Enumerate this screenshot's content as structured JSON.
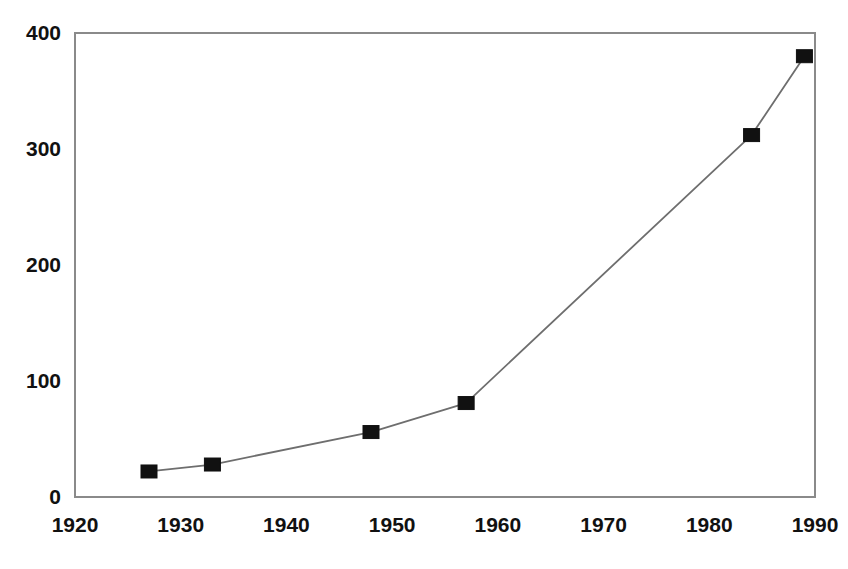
{
  "chart_data": {
    "type": "line",
    "title": "",
    "subtitle": "",
    "xlabel": "",
    "ylabel": "",
    "xlim": [
      1920,
      1990
    ],
    "ylim": [
      0,
      400
    ],
    "grid": false,
    "legend": null,
    "legend_position": "none",
    "x_ticks": [
      1920,
      1930,
      1940,
      1950,
      1960,
      1970,
      1980,
      1990
    ],
    "x_tick_labels": [
      "1920",
      "1930",
      "1940",
      "1950",
      "1960",
      "1970",
      "1980",
      "1990"
    ],
    "y_ticks": [
      0,
      100,
      200,
      300,
      400
    ],
    "y_tick_labels": [
      "0",
      "100",
      "200",
      "300",
      "400"
    ],
    "marker": "filled-square",
    "series": [
      {
        "name": "series-1",
        "color": "#111111",
        "line_color": "#6e6e6e",
        "x": [
          1927,
          1933,
          1948,
          1957,
          1984,
          1989
        ],
        "values": [
          22,
          28,
          56,
          81,
          312,
          380
        ],
        "points": [
          {
            "x": 1927,
            "y": 22
          },
          {
            "x": 1933,
            "y": 28
          },
          {
            "x": 1948,
            "y": 56
          },
          {
            "x": 1957,
            "y": 81
          },
          {
            "x": 1984,
            "y": 312
          },
          {
            "x": 1989,
            "y": 380
          }
        ]
      }
    ],
    "colors": {
      "background": "#ffffff",
      "axis": "#8a8a8a",
      "marker": "#111111",
      "line": "#6e6e6e",
      "text": "#111111"
    }
  },
  "plot_geometry": {
    "left": 75,
    "right": 815,
    "top": 33,
    "bottom": 497,
    "marker_width": 16,
    "marker_height": 13
  }
}
